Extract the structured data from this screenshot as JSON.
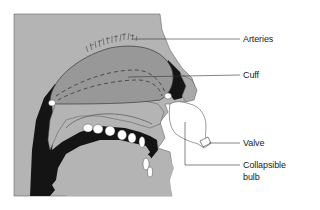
{
  "diagram": {
    "labels": {
      "arteries": "Arteries",
      "cuff": "Cuff",
      "valve": "Valve",
      "collapsible_bulb_line1": "Collapsible",
      "collapsible_bulb_line2": "bulb"
    },
    "colors": {
      "background": "#ffffff",
      "tissue_light": "#b4b4b4",
      "tissue_mid": "#9a9a9a",
      "cavity_dark": "#141414",
      "teeth": "#ffffff",
      "leader_lines": "#333333"
    }
  }
}
